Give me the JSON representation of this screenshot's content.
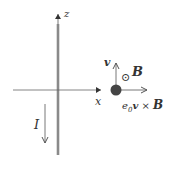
{
  "diagram": {
    "axes": {
      "z_label": "z",
      "x_label": "x"
    },
    "wire": {
      "current_label": "I",
      "current_direction": "down"
    },
    "particle": {
      "velocity_label": "v",
      "field_symbol": "⊙",
      "field_label": "B",
      "force_label_prefix": "e",
      "force_label_sub": "0",
      "force_label_v": "v",
      "force_label_cross": " × ",
      "force_label_B": "B"
    },
    "colors": {
      "wire": "#8a8a8a",
      "axis": "#555555",
      "particle": "#444444",
      "text": "#333333"
    }
  }
}
